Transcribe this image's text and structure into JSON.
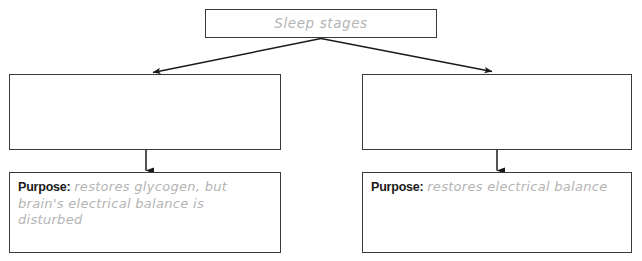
{
  "diagram": {
    "title_box": {
      "label": "Sleep stages"
    },
    "branches": [
      {
        "side": "left",
        "answer_box": {
          "label": "",
          "placeholder": ""
        },
        "purpose_box": {
          "label": "Purpose:",
          "value": "restores glycogen, but brain's electrical balance is disturbed"
        }
      },
      {
        "side": "right",
        "answer_box": {
          "label": "",
          "placeholder": ""
        },
        "purpose_box": {
          "label": "Purpose:",
          "value": "restores electrical balance"
        }
      }
    ],
    "connectors": [
      {
        "name": "title-to-left-branch",
        "type": "diagonal-arrow"
      },
      {
        "name": "title-to-right-branch",
        "type": "diagonal-arrow"
      },
      {
        "name": "left-branch-to-left-purpose",
        "type": "vertical-arrow"
      },
      {
        "name": "right-branch-to-right-purpose",
        "type": "vertical-arrow"
      }
    ],
    "colors": {
      "box_border": "#3a3a3a",
      "handwriting_text": "#b4b4b4",
      "label_text": "#1a1a1a",
      "arrow": "#1a1a1a",
      "background": "#ffffff"
    },
    "scan_artifact_text": " "
  }
}
